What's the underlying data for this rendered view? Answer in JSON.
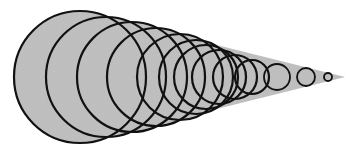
{
  "figure": {
    "cone_color": "#bdbdbd",
    "stroke_color": "#111111",
    "background": "#ffffff",
    "apex": {
      "x": 345,
      "y": 77
    },
    "circles": [
      {
        "cx": 80,
        "cy": 77,
        "r": 66
      },
      {
        "cx": 106,
        "cy": 77,
        "r": 60
      },
      {
        "cx": 132,
        "cy": 77,
        "r": 55
      },
      {
        "cx": 156,
        "cy": 77,
        "r": 49
      },
      {
        "cx": 180,
        "cy": 77,
        "r": 43
      },
      {
        "cx": 196,
        "cy": 77,
        "r": 37
      },
      {
        "cx": 206,
        "cy": 77,
        "r": 32
      },
      {
        "cx": 219,
        "cy": 77,
        "r": 27
      },
      {
        "cx": 235,
        "cy": 77,
        "r": 22
      },
      {
        "cx": 252,
        "cy": 77,
        "r": 17
      },
      {
        "cx": 277,
        "cy": 77,
        "r": 13
      },
      {
        "cx": 306,
        "cy": 77,
        "r": 9
      },
      {
        "cx": 328,
        "cy": 77,
        "r": 4
      }
    ]
  }
}
